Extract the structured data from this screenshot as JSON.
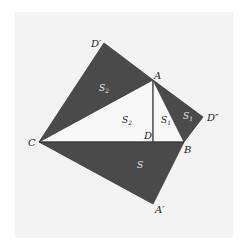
{
  "diagram": {
    "type": "geometric-proof",
    "colors": {
      "background": "#ffffff",
      "panel": "#f3f3f3",
      "dark_fill": "#4a4a4a",
      "light_fill": "#f8f8f8",
      "stroke": "#3a3a3a"
    },
    "points": {
      "D_prime": {
        "label": "D′",
        "x": 104,
        "y": 43
      },
      "A": {
        "label": "A",
        "x": 153,
        "y": 80
      },
      "D_double_prime": {
        "label": "D″",
        "x": 203,
        "y": 117
      },
      "B": {
        "label": "B",
        "x": 184,
        "y": 142
      },
      "C": {
        "label": "C",
        "x": 39,
        "y": 142
      },
      "D": {
        "label": "D",
        "x": 153,
        "y": 142
      },
      "A_prime": {
        "label": "A′",
        "x": 153,
        "y": 204
      }
    },
    "regions": [
      {
        "name": "S2",
        "label": "S",
        "subscript": "2",
        "shade": "dark",
        "vertices": [
          "C",
          "D_prime",
          "A"
        ]
      },
      {
        "name": "S1",
        "label": "S",
        "subscript": "1",
        "shade": "dark",
        "vertices": [
          "A",
          "D_double_prime",
          "B"
        ]
      },
      {
        "name": "S",
        "label": "S",
        "subscript": "",
        "shade": "dark",
        "vertices": [
          "C",
          "B",
          "A_prime"
        ]
      },
      {
        "name": "S2-inner",
        "label": "S",
        "subscript": "2",
        "shade": "light",
        "vertices": [
          "C",
          "A",
          "D"
        ]
      },
      {
        "name": "S1-inner",
        "label": "S",
        "subscript": "1",
        "shade": "light",
        "vertices": [
          "A",
          "B",
          "D"
        ]
      }
    ],
    "labels": {
      "D_prime": "D′",
      "A": "A",
      "D_double_prime": "D″",
      "C": "C",
      "D": "D",
      "B": "B",
      "A_prime": "A′",
      "S2_outer": "S",
      "S2_outer_sub": "2",
      "S2_inner": "S",
      "S2_inner_sub": "2",
      "S1_inner": "S",
      "S1_inner_sub": "1",
      "S1_outer": "S",
      "S1_outer_sub": "1",
      "S_main": "S"
    }
  }
}
